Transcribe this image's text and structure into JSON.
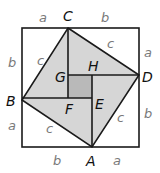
{
  "diagram": {
    "title": "",
    "colors": {
      "outer_fill": "#ffffff",
      "tilted_square_fill": "#d6d6d6",
      "inner_square_fill": "#b9b9b9",
      "stroke": "#1a1a1a",
      "vertex_label": "#111111",
      "side_label": "#7a7a7a"
    },
    "vertices": {
      "C": "C",
      "D": "D",
      "A": "A",
      "B": "B",
      "G": "G",
      "H": "H",
      "E": "E",
      "F": "F"
    },
    "side_labels": {
      "top_a": "a",
      "top_b": "b",
      "left_b": "b",
      "left_a": "a",
      "right_a": "a",
      "right_b": "b",
      "bottom_b": "b",
      "bottom_a": "a",
      "hyp_cd": "c",
      "hyp_bc": "c",
      "hyp_ab": "c",
      "hyp_ad": "c"
    }
  }
}
